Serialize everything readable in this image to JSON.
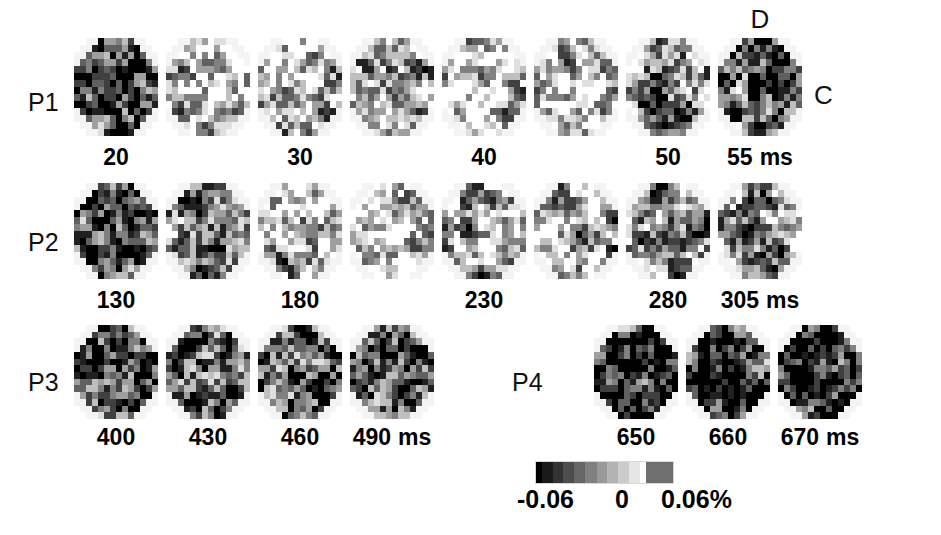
{
  "figure": {
    "type": "optical-imaging-activity-maps",
    "background_color": "#ffffff",
    "orientation": {
      "dorsal_label": "D",
      "caudal_label": "C"
    }
  },
  "colorbar": {
    "name": "grayscale-percent-change",
    "min_label": "-0.06",
    "mid_label": "0",
    "max_label": "0.06%",
    "low_color": "#000000",
    "mid_color": "#808080",
    "high_color": "#ffffff",
    "tail_color": "#6f6f6f"
  },
  "rows": [
    {
      "label": "P1",
      "label_x": 28,
      "label_y": 88,
      "panel_top": 38,
      "panel_width": 84,
      "panel_height": 98,
      "label_row_y": 144,
      "panels": [
        {
          "x": 74,
          "time": "20",
          "unit": "",
          "show_label": true,
          "tone": 0.26,
          "seed": 101
        },
        {
          "x": 166,
          "time": "",
          "unit": "",
          "show_label": false,
          "tone": 0.78,
          "seed": 102
        },
        {
          "x": 258,
          "time": "30",
          "unit": "",
          "show_label": true,
          "tone": 0.76,
          "seed": 103
        },
        {
          "x": 350,
          "time": "",
          "unit": "",
          "show_label": false,
          "tone": 0.62,
          "seed": 104
        },
        {
          "x": 442,
          "time": "40",
          "unit": "",
          "show_label": true,
          "tone": 0.8,
          "seed": 105
        },
        {
          "x": 534,
          "time": "",
          "unit": "",
          "show_label": false,
          "tone": 0.79,
          "seed": 106
        },
        {
          "x": 626,
          "time": "50",
          "unit": "",
          "show_label": true,
          "tone": 0.5,
          "seed": 107
        },
        {
          "x": 718,
          "time": "55",
          "unit": "ms",
          "show_label": true,
          "tone": 0.3,
          "seed": 108
        }
      ]
    },
    {
      "label": "P2",
      "label_x": 28,
      "label_y": 228,
      "panel_top": 183,
      "panel_width": 84,
      "panel_height": 96,
      "label_row_y": 287,
      "panels": [
        {
          "x": 74,
          "time": "130",
          "unit": "",
          "show_label": true,
          "tone": 0.22,
          "seed": 201
        },
        {
          "x": 166,
          "time": "",
          "unit": "",
          "show_label": false,
          "tone": 0.4,
          "seed": 202
        },
        {
          "x": 258,
          "time": "180",
          "unit": "",
          "show_label": true,
          "tone": 0.74,
          "seed": 203
        },
        {
          "x": 350,
          "time": "",
          "unit": "",
          "show_label": false,
          "tone": 0.83,
          "seed": 204
        },
        {
          "x": 442,
          "time": "230",
          "unit": "",
          "show_label": true,
          "tone": 0.7,
          "seed": 205
        },
        {
          "x": 534,
          "time": "",
          "unit": "",
          "show_label": false,
          "tone": 0.66,
          "seed": 206
        },
        {
          "x": 626,
          "time": "280",
          "unit": "",
          "show_label": true,
          "tone": 0.56,
          "seed": 207
        },
        {
          "x": 718,
          "time": "305",
          "unit": "ms",
          "show_label": true,
          "tone": 0.52,
          "seed": 208
        }
      ]
    },
    {
      "label": "P3",
      "label_x": 28,
      "label_y": 368,
      "panel_top": 325,
      "panel_width": 84,
      "panel_height": 94,
      "label_row_y": 424,
      "panels": [
        {
          "x": 74,
          "time": "400",
          "unit": "",
          "show_label": true,
          "tone": 0.3,
          "seed": 301
        },
        {
          "x": 166,
          "time": "430",
          "unit": "",
          "show_label": true,
          "tone": 0.42,
          "seed": 302
        },
        {
          "x": 258,
          "time": "460",
          "unit": "",
          "show_label": true,
          "tone": 0.33,
          "seed": 303
        },
        {
          "x": 350,
          "time": "490",
          "unit": "ms",
          "show_label": true,
          "tone": 0.31,
          "seed": 304
        }
      ]
    },
    {
      "label": "P4",
      "label_x": 512,
      "label_y": 368,
      "panel_top": 325,
      "panel_width": 84,
      "panel_height": 94,
      "label_row_y": 424,
      "panels": [
        {
          "x": 594,
          "time": "650",
          "unit": "",
          "show_label": true,
          "tone": 0.12,
          "seed": 401
        },
        {
          "x": 686,
          "time": "660",
          "unit": "",
          "show_label": true,
          "tone": 0.11,
          "seed": 402
        },
        {
          "x": 778,
          "time": "670",
          "unit": "ms",
          "show_label": true,
          "tone": 0.12,
          "seed": 403
        }
      ]
    }
  ]
}
